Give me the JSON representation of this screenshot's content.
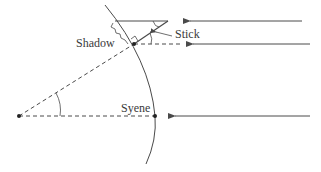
{
  "diagram": {
    "labels": {
      "shadow": "Shadow",
      "stick": "Stick",
      "syene": "Syene"
    },
    "colors": {
      "line": "#4a4a4a",
      "background": "#ffffff"
    },
    "elements": [
      {
        "id": "earth-arc",
        "type": "arc"
      },
      {
        "id": "center-point",
        "type": "dot"
      },
      {
        "id": "syene-point",
        "type": "dot"
      },
      {
        "id": "stick-point",
        "type": "dot"
      },
      {
        "id": "radius-to-syene",
        "type": "dashed-line"
      },
      {
        "id": "radius-to-stick",
        "type": "dashed-line"
      },
      {
        "id": "stick",
        "type": "line"
      },
      {
        "id": "sun-ray-top",
        "type": "arrow"
      },
      {
        "id": "sun-ray-middle",
        "type": "arrow"
      },
      {
        "id": "sun-ray-bottom",
        "type": "arrow"
      },
      {
        "id": "center-angle-arc",
        "type": "angle-mark"
      },
      {
        "id": "stick-angle-arc",
        "type": "angle-mark"
      },
      {
        "id": "right-angle-mark",
        "type": "angle-mark"
      }
    ]
  }
}
